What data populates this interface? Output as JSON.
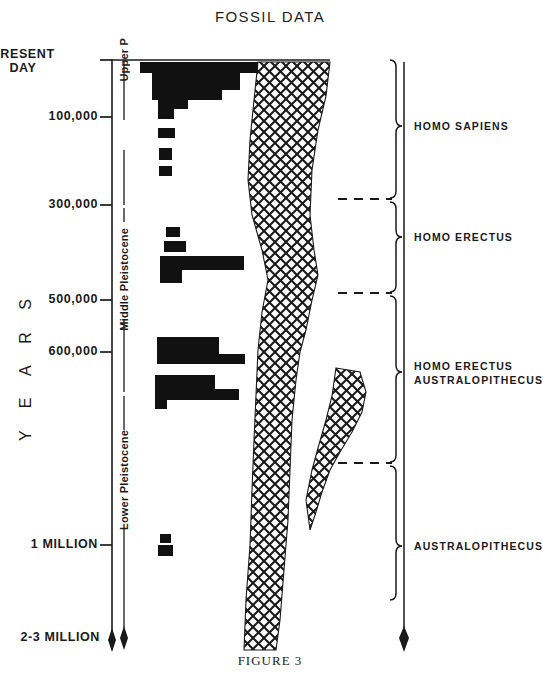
{
  "title": "FOSSIL DATA",
  "figure_caption": "FIGURE 3",
  "axis": {
    "name": "Y E A R S",
    "ticks": [
      {
        "label": "PRESENT",
        "label2": "DAY",
        "y": 60,
        "value": 0
      },
      {
        "label": "100,000",
        "y": 117,
        "value": 100000
      },
      {
        "label": "300,000",
        "y": 205,
        "value": 300000
      },
      {
        "label": "500,000",
        "y": 300,
        "value": 500000
      },
      {
        "label": "600,000",
        "y": 352,
        "value": 600000
      },
      {
        "label": "1 MILLION",
        "y": 545,
        "value": 1000000
      },
      {
        "label": "2-3 MILLION",
        "y": 638,
        "value": 2500000
      }
    ]
  },
  "epochs": [
    {
      "name": "Upper P",
      "full": "Upper Pleistocene",
      "y_top": 60,
      "y_bottom": 175
    },
    {
      "name": "Middle  Pleistocene",
      "y_top": 175,
      "y_bottom": 400
    },
    {
      "name": "Lower Pleistocene",
      "y_top": 400,
      "y_bottom": 628
    }
  ],
  "taxa": [
    {
      "label": "HOMO SAPIENS",
      "bracket_top": 60,
      "bracket_bottom": 198,
      "label_y": 126
    },
    {
      "label": "HOMO  ERECTUS",
      "bracket_top": 202,
      "bracket_bottom": 292,
      "label_y": 237
    },
    {
      "label": "HOMO  ERECTUS",
      "label2": "AUSTRALOPITHECUS",
      "bracket_top": 296,
      "bracket_bottom": 462,
      "label_y": 372
    },
    {
      "label": "AUSTRALOPITHECUS",
      "bracket_top": 466,
      "bracket_bottom": 600,
      "label_y": 546
    }
  ],
  "chart_data": {
    "type": "bar",
    "title": "FOSSIL DATA",
    "xlabel": "",
    "ylabel": "Y E A R S",
    "orientation": "horizontal",
    "ylim": [
      0,
      2500000
    ],
    "y_axis_inverted": true,
    "grid": false,
    "legend": "none",
    "bars": [
      {
        "y": 62,
        "height": 11,
        "x": 140,
        "width": 118
      },
      {
        "y": 73,
        "height": 17,
        "x": 152,
        "width": 88
      },
      {
        "y": 90,
        "height": 10,
        "x": 152,
        "width": 70
      },
      {
        "y": 100,
        "height": 9,
        "x": 158,
        "width": 30
      },
      {
        "y": 109,
        "height": 10,
        "x": 158,
        "width": 16
      },
      {
        "y": 128,
        "height": 10,
        "x": 158,
        "width": 17
      },
      {
        "y": 148,
        "height": 12,
        "x": 159,
        "width": 13
      },
      {
        "y": 166,
        "height": 10,
        "x": 159,
        "width": 13
      },
      {
        "y": 227,
        "height": 10,
        "x": 166,
        "width": 14
      },
      {
        "y": 241,
        "height": 11,
        "x": 164,
        "width": 22
      },
      {
        "y": 256,
        "height": 14,
        "x": 160,
        "width": 84
      },
      {
        "y": 270,
        "height": 13,
        "x": 160,
        "width": 22
      },
      {
        "y": 337,
        "height": 17,
        "x": 157,
        "width": 62
      },
      {
        "y": 354,
        "height": 10,
        "x": 157,
        "width": 88
      },
      {
        "y": 375,
        "height": 14,
        "x": 155,
        "width": 60
      },
      {
        "y": 389,
        "height": 11,
        "x": 155,
        "width": 84
      },
      {
        "y": 400,
        "height": 9,
        "x": 155,
        "width": 12
      },
      {
        "y": 534,
        "height": 9,
        "x": 160,
        "width": 11
      },
      {
        "y": 545,
        "height": 11,
        "x": 158,
        "width": 15
      }
    ],
    "lineage_band": {
      "fill": "cross-hatch",
      "main_outline": [
        [
          258,
          62
        ],
        [
          330,
          62
        ],
        [
          326,
          96
        ],
        [
          318,
          130
        ],
        [
          312,
          170
        ],
        [
          310,
          215
        ],
        [
          314,
          250
        ],
        [
          318,
          275
        ],
        [
          312,
          300
        ],
        [
          306,
          330
        ],
        [
          300,
          352
        ],
        [
          296,
          380
        ],
        [
          292,
          420
        ],
        [
          290,
          470
        ],
        [
          288,
          520
        ],
        [
          284,
          570
        ],
        [
          280,
          620
        ],
        [
          276,
          650
        ],
        [
          244,
          650
        ],
        [
          246,
          600
        ],
        [
          250,
          545
        ],
        [
          252,
          490
        ],
        [
          254,
          440
        ],
        [
          256,
          395
        ],
        [
          258,
          350
        ],
        [
          262,
          312
        ],
        [
          268,
          280
        ],
        [
          262,
          250
        ],
        [
          252,
          215
        ],
        [
          248,
          180
        ],
        [
          250,
          140
        ],
        [
          254,
          100
        ]
      ],
      "branch_outline": [
        [
          336,
          368
        ],
        [
          360,
          372
        ],
        [
          366,
          392
        ],
        [
          362,
          412
        ],
        [
          352,
          432
        ],
        [
          340,
          452
        ],
        [
          330,
          470
        ],
        [
          322,
          492
        ],
        [
          316,
          512
        ],
        [
          310,
          530
        ],
        [
          306,
          500
        ],
        [
          312,
          470
        ],
        [
          318,
          448
        ],
        [
          326,
          420
        ],
        [
          332,
          396
        ]
      ]
    },
    "separators": [
      {
        "y": 199,
        "x1": 338,
        "x2": 392,
        "style": "dashed"
      },
      {
        "y": 293,
        "x1": 338,
        "x2": 392,
        "style": "dashed"
      },
      {
        "y": 463,
        "x1": 338,
        "x2": 392,
        "style": "dashed"
      }
    ]
  },
  "colors": {
    "ink": "#1a1a1a",
    "bar": "#111111",
    "background": "#ffffff"
  }
}
